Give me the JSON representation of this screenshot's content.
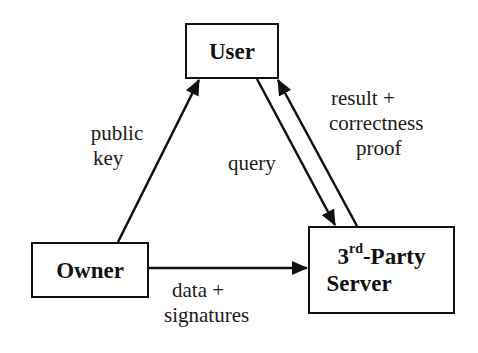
{
  "nodes": {
    "user": {
      "label": "User"
    },
    "owner": {
      "label": "Owner"
    },
    "server": {
      "line1_prefix": "3",
      "line1_sup": "rd",
      "line1_suffix": "-Party",
      "line2": "Server"
    }
  },
  "edges": {
    "public_key": {
      "from": "Owner",
      "to": "User",
      "line1": "public",
      "line2": "key"
    },
    "query": {
      "from": "User",
      "to": "3rd-Party Server",
      "label": "query"
    },
    "result": {
      "from": "3rd-Party Server",
      "to": "User",
      "line1": "result +",
      "line2": "correctness",
      "line3": "proof"
    },
    "data": {
      "from": "Owner",
      "to": "3rd-Party Server",
      "line1": "data +",
      "line2": "signatures"
    }
  },
  "colors": {
    "stroke": "#111111",
    "background": "#ffffff"
  }
}
